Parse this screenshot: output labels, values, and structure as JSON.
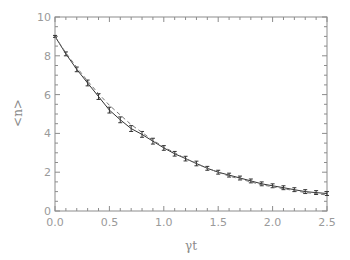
{
  "chart_data": {
    "type": "line",
    "title": "",
    "xlabel": "γt",
    "ylabel": "<n>",
    "xlim": [
      0.0,
      2.5
    ],
    "ylim": [
      0,
      10
    ],
    "x_ticks": [
      "0.0",
      "0.5",
      "1.0",
      "1.5",
      "2.0",
      "2.5"
    ],
    "y_ticks": [
      "0",
      "2",
      "4",
      "6",
      "8",
      "10"
    ],
    "grid": false,
    "legend": null,
    "series": [
      {
        "name": "simulation (with error bars)",
        "style": "solid-with-errorbars",
        "x": [
          0.0,
          0.1,
          0.2,
          0.3,
          0.4,
          0.5,
          0.6,
          0.7,
          0.8,
          0.9,
          1.0,
          1.1,
          1.2,
          1.3,
          1.4,
          1.5,
          1.6,
          1.7,
          1.8,
          1.9,
          2.0,
          2.1,
          2.2,
          2.3,
          2.4,
          2.5
        ],
        "values": [
          9.0,
          8.1,
          7.3,
          6.6,
          5.9,
          5.2,
          4.7,
          4.25,
          3.95,
          3.6,
          3.25,
          2.95,
          2.7,
          2.45,
          2.2,
          2.0,
          1.85,
          1.7,
          1.55,
          1.4,
          1.3,
          1.2,
          1.1,
          1.0,
          0.95,
          0.9
        ],
        "error": [
          0.05,
          0.1,
          0.12,
          0.15,
          0.15,
          0.15,
          0.15,
          0.15,
          0.15,
          0.15,
          0.12,
          0.12,
          0.12,
          0.12,
          0.1,
          0.1,
          0.1,
          0.1,
          0.1,
          0.1,
          0.1,
          0.1,
          0.1,
          0.1,
          0.1,
          0.1
        ]
      },
      {
        "name": "theory (dashed)",
        "style": "dashed",
        "x": [
          0.0,
          0.1,
          0.2,
          0.3,
          0.4,
          0.5,
          0.6,
          0.7,
          0.8,
          0.9,
          1.0,
          1.1,
          1.2,
          1.3,
          1.4,
          1.5,
          1.6,
          1.7,
          1.8,
          1.9,
          2.0,
          2.1,
          2.2,
          2.3,
          2.4,
          2.5
        ],
        "values": [
          9.0,
          8.15,
          7.4,
          6.7,
          6.05,
          5.45,
          4.95,
          4.45,
          4.05,
          3.65,
          3.3,
          3.0,
          2.7,
          2.45,
          2.2,
          2.0,
          1.8,
          1.65,
          1.5,
          1.35,
          1.25,
          1.15,
          1.05,
          0.95,
          0.9,
          0.82
        ]
      }
    ]
  },
  "colors": {
    "axis": "#8c8c8c",
    "line": "#333333",
    "dashed": "#777777"
  }
}
